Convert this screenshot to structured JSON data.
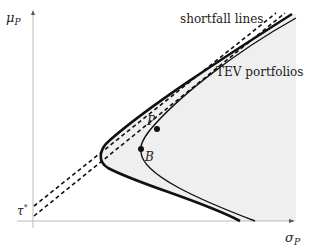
{
  "diagram": {
    "axes": {
      "y_label": "μ",
      "y_label_sub": "P",
      "x_label": "σ",
      "x_label_sub": "P",
      "y_intercept_label": "τ",
      "y_intercept_sup": "*"
    },
    "annotations": {
      "shortfall_lines": "shortfall lines",
      "tev_portfolios": "TEV portfolios",
      "point_p": "P",
      "point_b": "B"
    },
    "colors": {
      "curve": "#111111",
      "shade": "#efefef",
      "axis": "#bbbbbb",
      "text": "#222222"
    }
  }
}
